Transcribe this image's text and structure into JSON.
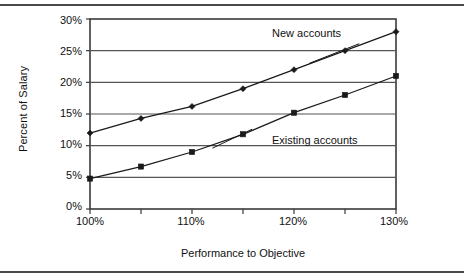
{
  "figure": {
    "top_rule": "horizontal-rule",
    "bottom_rule": "horizontal-rule",
    "background": "#ffffff",
    "line_color": "#1a1a1a",
    "grid_color": "#555555",
    "frame_color": "#3a3a3a"
  },
  "chart_data": {
    "type": "line",
    "title": "",
    "xlabel": "Performance to Objective",
    "ylabel": "Percent of Salary",
    "x": [
      100,
      105,
      110,
      115,
      120,
      125,
      130
    ],
    "xtick_labels": [
      "100%",
      "",
      "110%",
      "",
      "120%",
      "",
      "130%"
    ],
    "xtick_labels_major": [
      "100%",
      "110%",
      "120%",
      "130%"
    ],
    "ytick_labels": [
      "0%",
      "5%",
      "10%",
      "15%",
      "20%",
      "25%",
      "30%"
    ],
    "yticks": [
      0,
      5,
      10,
      15,
      20,
      25,
      30
    ],
    "xlim": [
      100,
      130
    ],
    "ylim": [
      0,
      30
    ],
    "grid": "horizontal",
    "legend": "inline-annotations",
    "series": [
      {
        "name": "New accounts",
        "marker": "diamond",
        "values": [
          12.0,
          14.3,
          16.2,
          19.0,
          22.0,
          25.0,
          28.0
        ]
      },
      {
        "name": "Existing accounts",
        "marker": "square",
        "values": [
          4.8,
          6.7,
          9.0,
          11.8,
          15.2,
          18.0,
          21.0
        ]
      }
    ],
    "annotations": [
      {
        "text": "New accounts",
        "series": "New accounts"
      },
      {
        "text": "Existing accounts",
        "series": "Existing accounts"
      }
    ]
  }
}
